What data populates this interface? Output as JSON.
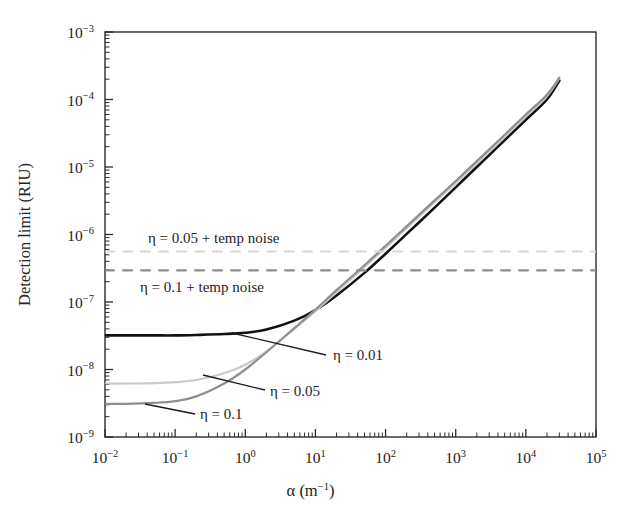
{
  "figure": {
    "background": "#ffffff",
    "frame_color": "#2b2b2b"
  },
  "chart_data": {
    "type": "line",
    "title": "",
    "xlabel": "α (m⁻¹)",
    "ylabel": "Detection limit (RIU)",
    "xscale": "log",
    "yscale": "log",
    "xlim": [
      0.01,
      100000
    ],
    "ylim": [
      1e-09,
      0.001
    ],
    "grid": false,
    "legend": "inline-annotations",
    "xticks": [
      "10⁻²",
      "10⁻¹",
      "10⁰",
      "10¹",
      "10²",
      "10³",
      "10⁴",
      "10⁵"
    ],
    "xtick_values": [
      0.01,
      0.1,
      1,
      10,
      100,
      1000,
      10000,
      100000
    ],
    "yticks": [
      "10⁻³",
      "10⁻⁴",
      "10⁻⁵",
      "10⁻⁶",
      "10⁻⁷",
      "10⁻⁸",
      "10⁻⁹"
    ],
    "ytick_values": [
      0.001,
      0.0001,
      1e-05,
      1e-06,
      1e-07,
      1e-08,
      1e-09
    ],
    "series": [
      {
        "name": "η = 0.01",
        "style": "solid",
        "color": "#111111",
        "width": 2.6,
        "x": [
          0.01,
          0.02,
          0.05,
          0.1,
          0.2,
          0.5,
          1,
          2,
          5,
          10,
          20,
          50,
          100,
          200,
          500,
          1000,
          2000,
          5000,
          10000,
          20000,
          30000
        ],
        "y": [
          3.2e-08,
          3.2e-08,
          3.2e-08,
          3.2e-08,
          3.25e-08,
          3.35e-08,
          3.5e-08,
          3.9e-08,
          5.3e-08,
          7.6e-08,
          1.25e-07,
          2.7e-07,
          5.2e-07,
          1.02e-06,
          2.5e-06,
          5e-06,
          1e-05,
          2.5e-05,
          5e-05,
          0.0001,
          0.00019
        ]
      },
      {
        "name": "η = 0.05",
        "style": "solid",
        "color": "#c9c9c9",
        "width": 2.2,
        "x": [
          0.01,
          0.02,
          0.05,
          0.1,
          0.2,
          0.5,
          1,
          2,
          5,
          10,
          20,
          50,
          100,
          200,
          500,
          1000,
          2000,
          5000,
          10000,
          20000,
          30000
        ],
        "y": [
          6.2e-09,
          6.2e-09,
          6.3e-09,
          6.5e-09,
          7e-09,
          8.8e-09,
          1.18e-08,
          1.85e-08,
          4e-08,
          7.3e-08,
          1.4e-07,
          3.3e-07,
          6.4e-07,
          1.25e-06,
          3e-06,
          5.8e-06,
          1.15e-05,
          2.8e-05,
          5.6e-05,
          0.000112,
          0.000205
        ]
      },
      {
        "name": "η = 0.1",
        "style": "solid",
        "color": "#8f8f8f",
        "width": 2.2,
        "x": [
          0.01,
          0.02,
          0.05,
          0.1,
          0.2,
          0.5,
          1,
          2,
          5,
          10,
          20,
          50,
          100,
          200,
          500,
          1000,
          2000,
          5000,
          10000,
          20000,
          30000
        ],
        "y": [
          3.1e-09,
          3.1e-09,
          3.2e-09,
          3.4e-09,
          4e-09,
          6.2e-09,
          1e-08,
          1.8e-08,
          4.1e-08,
          7.7e-08,
          1.5e-07,
          3.5e-07,
          6.8e-07,
          1.32e-06,
          3.2e-06,
          6.2e-06,
          1.22e-05,
          3e-05,
          6e-05,
          0.000118,
          0.00021
        ]
      },
      {
        "name": "η = 0.05 + temp noise",
        "style": "dashed",
        "color": "#d8d8d8",
        "width": 2.0,
        "x": [
          0.01,
          100000
        ],
        "y": [
          5.6e-07,
          5.6e-07
        ]
      },
      {
        "name": "η = 0.1 + temp noise",
        "style": "dashed",
        "color": "#8d8d8d",
        "width": 2.2,
        "x": [
          0.01,
          100000
        ],
        "y": [
          2.95e-07,
          2.95e-07
        ]
      }
    ],
    "annotations": [
      {
        "name": "eta-005-temp-noise-label",
        "text": "η = 0.05 + temp noise",
        "x_px": 148,
        "y_px": 243,
        "anchor": "start",
        "leader": null
      },
      {
        "name": "eta-01-temp-noise-label",
        "text": "η = 0.1 + temp noise",
        "x_px": 140,
        "y_px": 292,
        "anchor": "start",
        "leader": null
      },
      {
        "name": "eta-001-label",
        "text": "η = 0.01",
        "x_px": 333,
        "y_px": 360,
        "anchor": "start",
        "leader": [
          326,
          355,
          232,
          333
        ]
      },
      {
        "name": "eta-005-label",
        "text": "η = 0.05",
        "x_px": 270,
        "y_px": 396,
        "anchor": "start",
        "leader": [
          265,
          390,
          203,
          375
        ]
      },
      {
        "name": "eta-01-label",
        "text": "η = 0.1",
        "x_px": 200,
        "y_px": 419,
        "anchor": "start",
        "leader": [
          195,
          414,
          145,
          404
        ]
      }
    ]
  }
}
